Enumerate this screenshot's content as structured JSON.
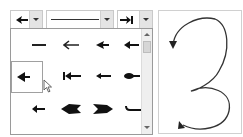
{
  "toolbar": {
    "start_arrow_dropdown": {
      "selected": "arrow-left-icon"
    },
    "line_style_dropdown": {
      "selected": "solid-line"
    },
    "end_arrow_dropdown": {
      "selected": "arrow-right-bar-icon"
    }
  },
  "arrow_list": {
    "rows": [
      [
        "none-line",
        "arrow-open-left",
        "arrow-filled-left",
        "arrow-filled-left-long"
      ],
      [
        "arrow-filled-left-short",
        "arrow-bar-left",
        "arrow-thin-left",
        "arrow-round-left"
      ],
      [
        "arrow-small-left",
        "arrow-chevron-left",
        "arrow-chevron-right",
        "arrow-hook"
      ]
    ],
    "selected_index": 4
  },
  "canvas": {
    "shape": "curved-3-connector",
    "stroke_color": "#333333"
  }
}
